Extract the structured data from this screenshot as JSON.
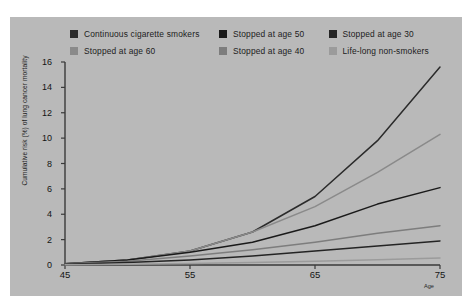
{
  "chart_data": {
    "type": "line",
    "title": "",
    "xlabel": "Age",
    "ylabel": "Cumulative risk (%) of lung cancer mortality",
    "xlim": [
      45,
      75
    ],
    "ylim": [
      0,
      16
    ],
    "grid": false,
    "legend_position": "top",
    "xticks": [
      45,
      55,
      65,
      75
    ],
    "yticks": [
      0,
      2,
      4,
      6,
      8,
      10,
      12,
      14,
      16
    ],
    "x": [
      45,
      50,
      55,
      60,
      65,
      70,
      75
    ],
    "series": [
      {
        "name": "Continuous cigarette smokers",
        "color": "#2b2b2b",
        "values": [
          0.1,
          0.4,
          1.1,
          2.6,
          5.4,
          9.8,
          15.6
        ]
      },
      {
        "name": "Stopped at age 60",
        "color": "#8a8a8a",
        "values": [
          0.1,
          0.4,
          1.1,
          2.6,
          4.6,
          7.3,
          10.3
        ]
      },
      {
        "name": "Stopped at age 50",
        "color": "#1a1a1a",
        "values": [
          0.1,
          0.4,
          1.0,
          1.8,
          3.1,
          4.8,
          6.1
        ]
      },
      {
        "name": "Stopped at age 40",
        "color": "#7d7d7d",
        "values": [
          0.1,
          0.3,
          0.7,
          1.2,
          1.8,
          2.5,
          3.1
        ]
      },
      {
        "name": "Stopped at age 30",
        "color": "#242424",
        "values": [
          0.05,
          0.2,
          0.4,
          0.7,
          1.1,
          1.5,
          1.9
        ]
      },
      {
        "name": "Life-long non-smokers",
        "color": "#9b9b9b",
        "values": [
          0.02,
          0.06,
          0.12,
          0.2,
          0.3,
          0.42,
          0.55
        ]
      }
    ]
  },
  "legend": {
    "rows": [
      [
        {
          "label": "Continuous cigarette smokers",
          "color": "#2b2b2b"
        },
        {
          "label": "Stopped at age 50",
          "color": "#1a1a1a"
        },
        {
          "label": "Stopped at age 30",
          "color": "#242424"
        }
      ],
      [
        {
          "label": "Stopped at age 60",
          "color": "#8a8a8a"
        },
        {
          "label": "Stopped at age 40",
          "color": "#7d7d7d"
        },
        {
          "label": "Life-long non-smokers",
          "color": "#9b9b9b"
        }
      ]
    ]
  },
  "colors": {
    "panel_background": "#b9b9b9",
    "axis": "#3a3a3a",
    "text": "#141414"
  }
}
